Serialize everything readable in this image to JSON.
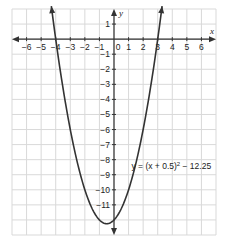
{
  "chart_data": {
    "type": "line",
    "title": "",
    "xlabel": "x",
    "ylabel": "y",
    "xlim": [
      -7,
      7
    ],
    "ylim": [
      -13,
      2
    ],
    "grid": true,
    "x_ticks": [
      -6,
      -5,
      -4,
      -3,
      -2,
      -1,
      0,
      1,
      2,
      3,
      4,
      5,
      6
    ],
    "x_tick_labels": [
      "−6",
      "−5",
      "−4",
      "−3",
      "−2",
      "−1",
      "0",
      "1",
      "2",
      "3",
      "4",
      "5",
      "6"
    ],
    "y_ticks": [
      1,
      -1,
      -2,
      -3,
      -4,
      -5,
      -6,
      -7,
      -8,
      -9,
      -10,
      -11
    ],
    "y_tick_labels": [
      "1",
      "−1",
      "−2",
      "−3",
      "−4",
      "−5",
      "−6",
      "−7",
      "−8",
      "−9",
      "−10",
      "−11"
    ],
    "series": [
      {
        "name": "y = (x + 0.5)² − 12.25",
        "function": "(x + 0.5)^2 - 12.25",
        "vertex": [
          -0.5,
          -12.25
        ],
        "x_intercepts": [
          -4,
          3
        ],
        "y_intercept": -12,
        "x_range": [
          -4.3,
          3.3
        ],
        "color": "#333333"
      }
    ],
    "annotations": [
      {
        "text_prefix": "y = (x + 0.5)",
        "superscript": "2",
        "text_suffix": " − 12.25",
        "x": 1.2,
        "y": -8.6
      }
    ]
  },
  "labels": {
    "x_axis": "x",
    "y_axis": "y",
    "equation_prefix": "y = (x + 0.5)",
    "equation_sup": "2",
    "equation_suffix": " − 12.25"
  },
  "colors": {
    "grid": "#d9d9d9",
    "axis": "#333333",
    "curve": "#333333",
    "text": "#222222"
  }
}
